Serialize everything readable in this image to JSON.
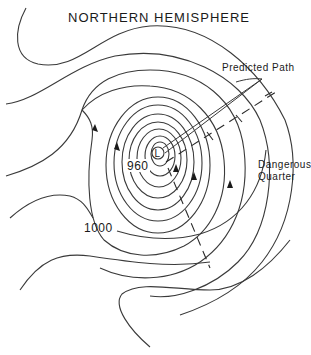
{
  "diagram": {
    "title": "NORTHERN HEMISPHERE",
    "center_label": "L",
    "pressure_labels": {
      "inner": "960",
      "outer": "1000"
    },
    "annotations": {
      "predicted_path": "Predicted Path",
      "dangerous_quarter_line1": "Dangerous",
      "dangerous_quarter_line2": "Quarter"
    },
    "colors": {
      "line": "#3a3a3a",
      "text": "#1a1a1a",
      "background": "#ffffff"
    }
  }
}
